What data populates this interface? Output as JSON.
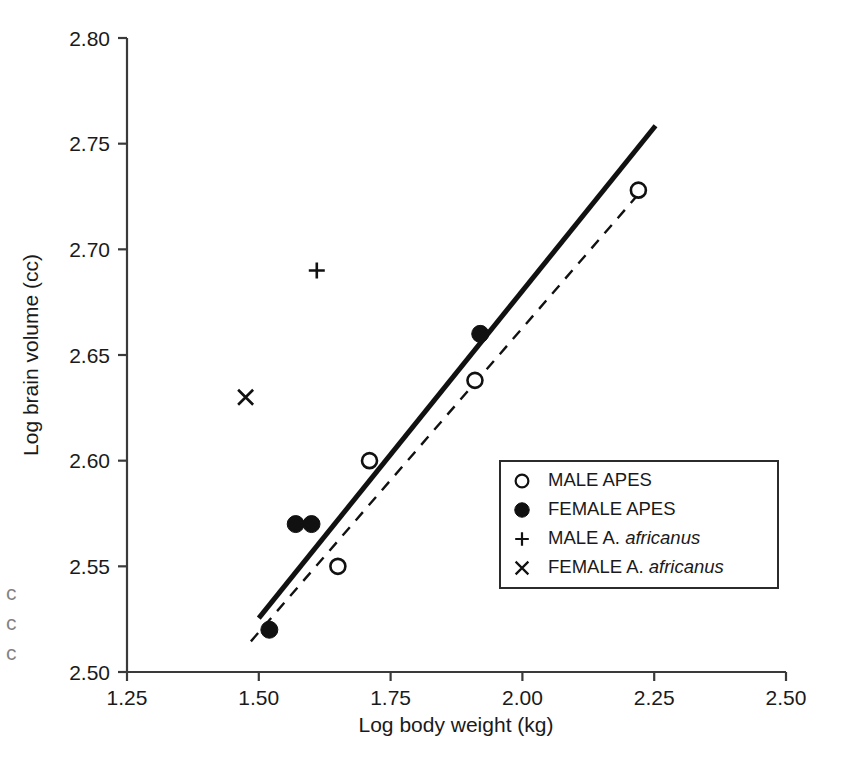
{
  "chart_data": {
    "type": "scatter",
    "title": "",
    "xlabel": "Log body weight (kg)",
    "ylabel": "Log brain volume (cc)",
    "xlim": [
      1.25,
      2.5
    ],
    "ylim": [
      2.5,
      2.8
    ],
    "xticks": [
      "1.25",
      "1.50",
      "1.75",
      "2.00",
      "2.25",
      "2.50"
    ],
    "yticks": [
      "2.50",
      "2.55",
      "2.60",
      "2.65",
      "2.70",
      "2.75",
      "2.80"
    ],
    "xtick_values": [
      1.25,
      1.5,
      1.75,
      2.0,
      2.25,
      2.5
    ],
    "ytick_values": [
      2.5,
      2.55,
      2.6,
      2.65,
      2.7,
      2.75,
      2.8
    ],
    "grid": false,
    "legend_position": "center-right",
    "series": [
      {
        "name": "MALE APES",
        "marker": "open-circle",
        "points": [
          {
            "x": 1.71,
            "y": 2.6
          },
          {
            "x": 1.65,
            "y": 2.55
          },
          {
            "x": 1.91,
            "y": 2.638
          },
          {
            "x": 2.22,
            "y": 2.728
          }
        ]
      },
      {
        "name": "FEMALE APES",
        "marker": "filled-circle",
        "points": [
          {
            "x": 1.52,
            "y": 2.52
          },
          {
            "x": 1.57,
            "y": 2.57
          },
          {
            "x": 1.6,
            "y": 2.57
          },
          {
            "x": 1.92,
            "y": 2.66
          }
        ]
      },
      {
        "name": "MALE A. africanus",
        "marker": "plus",
        "points": [
          {
            "x": 1.61,
            "y": 2.69
          }
        ]
      },
      {
        "name": "FEMALE A. africanus",
        "marker": "cross",
        "points": [
          {
            "x": 1.475,
            "y": 2.63
          }
        ]
      }
    ],
    "lines": [
      {
        "name": "female-apes-regression",
        "style": "solid",
        "width": 5,
        "color": "#111111",
        "x1": 1.5,
        "y1": 2.5255,
        "x2": 2.2525,
        "y2": 2.7585
      },
      {
        "name": "male-apes-regression",
        "style": "dashed",
        "width": 2.4,
        "color": "#111111",
        "x1": 1.485,
        "y1": 2.5145,
        "x2": 2.225,
        "y2": 2.7275
      }
    ],
    "colors": {
      "axis": "#3a3a3a",
      "marker": "#111111",
      "text": "#1a1a1a",
      "background": "#ffffff"
    }
  },
  "legend": {
    "items": [
      {
        "marker": "open-circle",
        "label": "MALE APES",
        "label_plain": "MALE APES",
        "label_italic": ""
      },
      {
        "marker": "filled-circle",
        "label": "FEMALE APES",
        "label_plain": "FEMALE APES",
        "label_italic": ""
      },
      {
        "marker": "plus",
        "label": "MALE A. africanus",
        "label_plain": "MALE A. ",
        "label_italic": "africanus"
      },
      {
        "marker": "cross",
        "label": "FEMALE A. africanus",
        "label_plain": "FEMALE A. ",
        "label_italic": "africanus"
      }
    ]
  },
  "axes": {
    "x_title": "Log body weight (kg)",
    "y_title": "Log brain volume (cc)"
  },
  "edge_artifact": {
    "text": "ccc"
  }
}
